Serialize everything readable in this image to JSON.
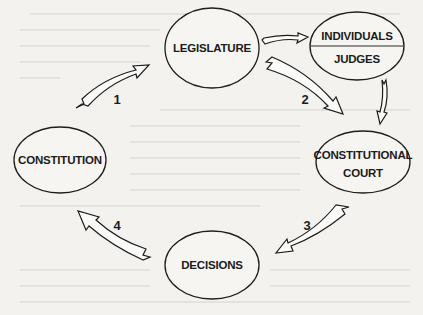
{
  "diagram": {
    "type": "cycle-flow",
    "nodes": {
      "legislature": {
        "label": "LEGISLATURE"
      },
      "individuals_judges": {
        "top_label": "INDIVIDUALS",
        "bottom_label": "JUDGES"
      },
      "constitutional_court": {
        "line1": "CONSTITUTIONAL",
        "line2": "COURT"
      },
      "decisions": {
        "label": "DECISIONS"
      },
      "constitution": {
        "label": "CONSTITUTION"
      }
    },
    "edges": [
      {
        "id": "1",
        "from": "CONSTITUTION",
        "to": "LEGISLATURE",
        "label": "1"
      },
      {
        "id": "2",
        "from": "LEGISLATURE",
        "to": "CONSTITUTIONAL COURT",
        "label": "2"
      },
      {
        "id": "3",
        "from": "CONSTITUTIONAL COURT",
        "to": "DECISIONS",
        "label": "3"
      },
      {
        "id": "4",
        "from": "DECISIONS",
        "to": "CONSTITUTION",
        "label": "4"
      },
      {
        "id": "a",
        "from": "LEGISLATURE",
        "to": "INDIVIDUALS / JUDGES",
        "label": ""
      },
      {
        "id": "b",
        "from": "INDIVIDUALS / JUDGES",
        "to": "CONSTITUTIONAL COURT",
        "label": ""
      }
    ],
    "step_labels": {
      "one": "1",
      "two": "2",
      "three": "3",
      "four": "4"
    },
    "colors": {
      "background": "#f3f2ef",
      "stroke": "#1e1e1e",
      "fill": "#f6f5f2"
    }
  }
}
